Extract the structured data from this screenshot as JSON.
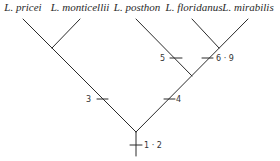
{
  "taxa": [
    {
      "name": "L. pricei",
      "x": 23
    },
    {
      "name": "L. monticellii",
      "x": 80
    },
    {
      "name": "L. posthon",
      "x": 136
    },
    {
      "name": "L. floridanus",
      "x": 192
    },
    {
      "name": "L. mirabilis",
      "x": 249
    }
  ],
  "character_marks": [
    {
      "label": "5",
      "side": "left"
    },
    {
      "label": "6 · 9",
      "side": "right"
    },
    {
      "label": "3",
      "side": "left"
    },
    {
      "label": "4",
      "side": "right"
    },
    {
      "label": "1 · 2",
      "side": "right"
    }
  ],
  "colors": {
    "line": "#2b2b2b",
    "background": "#ffffff"
  }
}
